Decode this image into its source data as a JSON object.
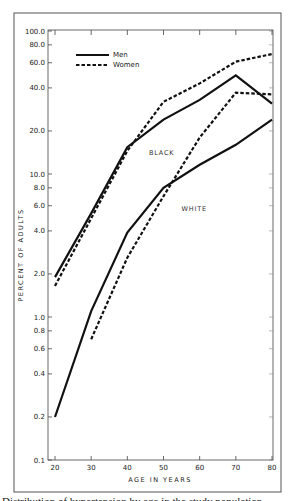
{
  "chart_data": {
    "type": "line",
    "title": "",
    "xlabel": "AGE IN YEARS",
    "ylabel": "PERCENT OF ADULTS",
    "yscale": "log",
    "xlim": [
      20,
      80
    ],
    "ylim": [
      0.1,
      100.0
    ],
    "x_ticks": [
      20,
      30,
      40,
      50,
      60,
      70,
      80
    ],
    "x_tick_labels": [
      "20",
      "30",
      "40",
      "50",
      "60",
      "70",
      "80"
    ],
    "y_ticks": [
      0.1,
      0.2,
      0.4,
      0.6,
      0.8,
      1.0,
      2.0,
      4.0,
      6.0,
      8.0,
      10.0,
      20.0,
      40.0,
      60.0,
      80.0,
      100.0
    ],
    "y_tick_labels": [
      "0.1",
      "0.2",
      "0.4",
      "0.6",
      "0.8",
      "1.0",
      "2.0",
      "4.0",
      "6.0",
      "8.0",
      "10.0",
      "20.0",
      "40.0",
      "60.0",
      "80.0",
      "100.0"
    ],
    "grid": false,
    "legend": {
      "position": "upper left",
      "entries": [
        {
          "label": "Men",
          "style": "solid"
        },
        {
          "label": "Women",
          "style": "dashed"
        }
      ]
    },
    "annotations": [
      {
        "text": "BLACK",
        "x": 46,
        "y": 13.5
      },
      {
        "text": "WHITE",
        "x": 55,
        "y": 5.5
      }
    ],
    "series": [
      {
        "name": "Black Men",
        "group": "BLACK",
        "sex": "Men",
        "style": "solid",
        "x": [
          20,
          30,
          40,
          50,
          60,
          70,
          80
        ],
        "values": [
          1.9,
          5.3,
          15.4,
          24.0,
          33.0,
          49.0,
          31.0
        ]
      },
      {
        "name": "Black Women",
        "group": "BLACK",
        "sex": "Women",
        "style": "dashed",
        "x": [
          20,
          30,
          40,
          50,
          60,
          70,
          80
        ],
        "values": [
          1.65,
          4.9,
          14.5,
          32.0,
          43.0,
          61.0,
          69.0
        ]
      },
      {
        "name": "White Men",
        "group": "WHITE",
        "sex": "Men",
        "style": "solid",
        "x": [
          20,
          30,
          40,
          50,
          60,
          70,
          80
        ],
        "values": [
          0.2,
          1.1,
          3.9,
          8.0,
          11.6,
          16.0,
          24.0
        ]
      },
      {
        "name": "White Women",
        "group": "WHITE",
        "sex": "Women",
        "style": "dashed",
        "x": [
          30,
          40,
          50,
          60,
          70,
          80
        ],
        "values": [
          0.7,
          2.6,
          7.0,
          18.0,
          37.0,
          36.0
        ]
      }
    ]
  },
  "caption_text": "Distribution of hypertension by age in the study population"
}
